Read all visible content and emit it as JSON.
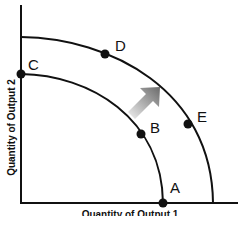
{
  "diagram": {
    "type": "production-possibilities-frontier",
    "axes": {
      "y_label": "Quantity of Output 2",
      "x_label": "Quantity of Output 1"
    },
    "curves": [
      {
        "name": "inner-frontier",
        "color": "#111111"
      },
      {
        "name": "outer-frontier",
        "color": "#111111"
      }
    ],
    "points": [
      {
        "label": "A",
        "curve": "inner-frontier"
      },
      {
        "label": "B",
        "curve": "inner-frontier"
      },
      {
        "label": "C",
        "curve": "inner-frontier"
      },
      {
        "label": "D",
        "curve": "outer-frontier"
      },
      {
        "label": "E",
        "curve": "outer-frontier"
      }
    ],
    "arrow": {
      "direction": "up-right",
      "meaning": "outward shift",
      "color": "#808080"
    }
  }
}
